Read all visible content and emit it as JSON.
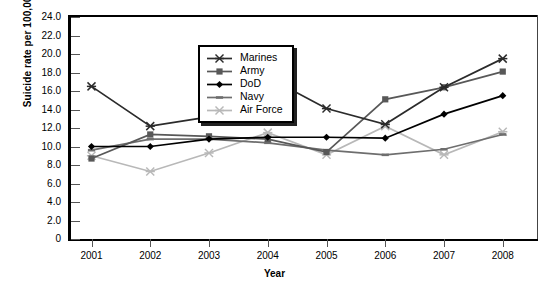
{
  "chart_data": {
    "type": "line",
    "title": "",
    "xlabel": "Year",
    "ylabel": "Suicide rate per 100,000 population",
    "categories": [
      "2001",
      "2002",
      "2003",
      "2004",
      "2005",
      "2006",
      "2007",
      "2008"
    ],
    "x": [
      2001,
      2002,
      2003,
      2004,
      2005,
      2006,
      2007,
      2008
    ],
    "xlim": [
      2000.6,
      2008.6
    ],
    "ylim": [
      0,
      24
    ],
    "ytick_labels": [
      "0",
      "2.0",
      "4.0",
      "6.0",
      "8.0",
      "10.0",
      "12.0",
      "14.0",
      "16.0",
      "18.0",
      "20.0",
      "22.0",
      "24.0"
    ],
    "ytick_values": [
      0,
      2,
      4,
      6,
      8,
      10,
      12,
      14,
      16,
      18,
      20,
      22,
      24
    ],
    "grid": false,
    "legend_position": "upper-left-inside",
    "series": [
      {
        "name": "Marines",
        "marker": "x-cross",
        "color": "#2b2b2b",
        "values": [
          16.5,
          12.2,
          13.2,
          17.5,
          14.1,
          12.4,
          16.4,
          19.5
        ]
      },
      {
        "name": "Army",
        "marker": "square",
        "color": "#585858",
        "values": [
          8.7,
          11.3,
          11.1,
          10.8,
          9.4,
          15.1,
          16.4,
          18.1
        ]
      },
      {
        "name": "DoD",
        "marker": "diamond",
        "color": "#000000",
        "values": [
          10.0,
          10.0,
          10.8,
          11.0,
          11.0,
          10.9,
          13.5,
          15.5
        ]
      },
      {
        "name": "Navy",
        "marker": "dash",
        "color": "#6e6e6e",
        "values": [
          9.6,
          10.8,
          10.8,
          10.4,
          9.6,
          9.1,
          9.7,
          11.3
        ]
      },
      {
        "name": "Air Force",
        "marker": "plus-cross",
        "color": "#b8b8b8",
        "values": [
          9.0,
          7.3,
          9.3,
          11.5,
          9.1,
          12.2,
          9.1,
          11.6
        ]
      }
    ]
  }
}
